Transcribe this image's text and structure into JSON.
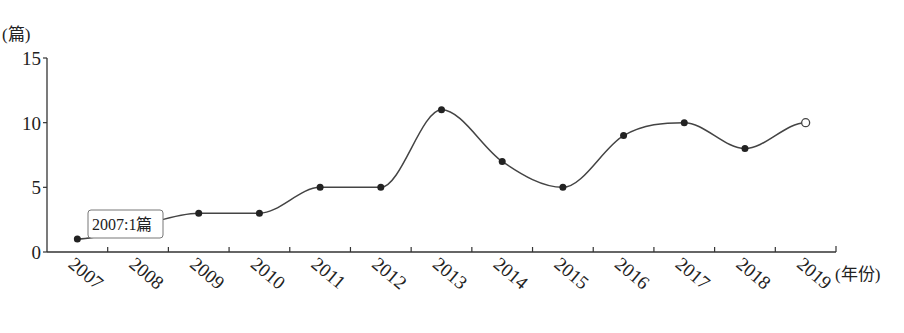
{
  "chart_data": {
    "type": "line",
    "title": "",
    "xlabel": "(年份)",
    "ylabel": "(篇)",
    "categories": [
      "2007",
      "2008",
      "2009",
      "2010",
      "2011",
      "2012",
      "2013",
      "2014",
      "2015",
      "2016",
      "2017",
      "2018",
      "2019"
    ],
    "series": [
      {
        "name": "篇数",
        "values": [
          1,
          2,
          3,
          3,
          5,
          5,
          11,
          7,
          5,
          9,
          10,
          8,
          10
        ]
      }
    ],
    "ylim": [
      0,
      15
    ],
    "yticks": [
      0,
      5,
      10,
      15
    ],
    "grid": false,
    "smooth": true,
    "last_point_open": true,
    "annotation": "2007:1篇"
  },
  "labels": {
    "y_unit": "(篇)",
    "x_unit": "(年份)",
    "tooltip": "2007:1篇"
  }
}
